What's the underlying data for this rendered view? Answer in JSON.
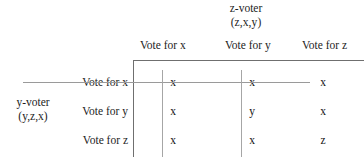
{
  "figure": {
    "clipped_top_text": "",
    "column_group": {
      "title": "z-voter",
      "preference": "(z,x,y)"
    },
    "row_group": {
      "title": "y-voter",
      "preference": "(y,z,x)"
    },
    "column_headers": [
      "Vote for x",
      "Vote for y",
      "Vote for z"
    ],
    "row_headers": [
      "Vote for x",
      "Vote for y",
      "Vote for z"
    ],
    "cells": [
      [
        "x",
        "x",
        "x"
      ],
      [
        "x",
        "y",
        "x"
      ],
      [
        "x",
        "x",
        "z"
      ]
    ],
    "marks": {
      "struck_row_index": 0,
      "struck_column_indices": [
        0,
        1
      ]
    },
    "colors": {
      "rule": "#6f6f6f",
      "strike": "#9a9a9a",
      "text": "#1d1d1d",
      "background": "#ffffff"
    }
  },
  "chart_data": {
    "type": "table",
    "title": "",
    "xlabel": "z-voter (z,x,y)",
    "ylabel": "y-voter (y,z,x)",
    "categories": [
      "Vote for x",
      "Vote for y",
      "Vote for z"
    ],
    "rows": [
      "Vote for x",
      "Vote for y",
      "Vote for z"
    ],
    "values": [
      [
        "x",
        "x",
        "x"
      ],
      [
        "x",
        "y",
        "x"
      ],
      [
        "x",
        "x",
        "z"
      ]
    ],
    "annotations": [
      "horizontal strike through row 'Vote for x'",
      "vertical strike through column 'Vote for x'",
      "vertical strike through column 'Vote for y'"
    ],
    "grid": false,
    "legend": "none"
  }
}
